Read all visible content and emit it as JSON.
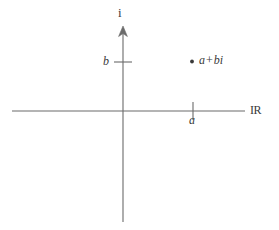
{
  "figure": {
    "background_color": "#ffffff",
    "line_color": "#6b6b6b",
    "text_color": "#3a3a3a",
    "width": 279,
    "height": 230
  },
  "axes": {
    "imaginary": {
      "label": "i",
      "name": "imaginary-axis",
      "orientation": "vertical",
      "has_arrow": true,
      "arrow_at": "top"
    },
    "real": {
      "label": "IR",
      "name": "real-axis",
      "orientation": "horizontal",
      "has_arrow": false
    },
    "origin": {
      "x": 123,
      "y": 111
    }
  },
  "ticks": [
    {
      "name": "tick-b",
      "label": "b",
      "axis": "imaginary",
      "position_px": 62
    },
    {
      "name": "tick-a",
      "label": "a",
      "axis": "real",
      "position_px": 193
    }
  ],
  "point": {
    "name": "complex-point",
    "label_real": "a",
    "label_operator": "+",
    "label_imaginary": "bi",
    "label_full": "a + bi",
    "x_px": 192,
    "y_px": 62,
    "marker": "filled-dot"
  }
}
